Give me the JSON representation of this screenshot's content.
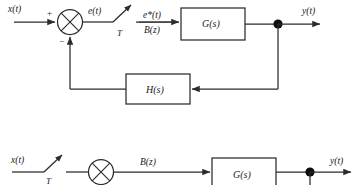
{
  "figure": {
    "kind": "control-system-block-diagram",
    "colors": {
      "line": "#2b2b2b",
      "text": "#1a1a1a",
      "node": "#0d0d0d",
      "background": "#ffffff"
    }
  },
  "diagram_top": {
    "input_label": "x(t)",
    "sum_plus_sign": "+",
    "sum_minus_sign": "−",
    "error_label": "e(t)",
    "sampler_period_label": "T",
    "sampled_label": "e*(t)",
    "ztransform_label": "B(z)",
    "forward_block_label": "G(s)",
    "feedback_block_label": "H(s)",
    "output_label": "y(t)"
  },
  "diagram_bottom": {
    "input_label": "x(t)",
    "sampler_period_label": "T",
    "ztransform_label": "B(z)",
    "forward_block_label": "G(s)",
    "output_label": "y(t)"
  }
}
